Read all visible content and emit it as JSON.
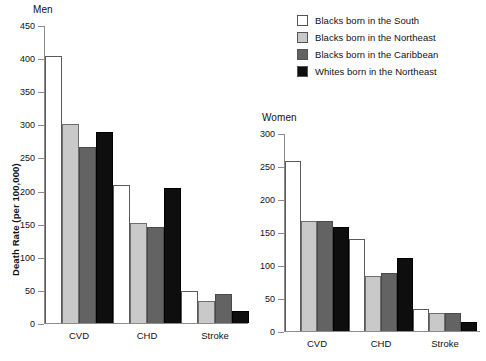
{
  "legend": {
    "position": "top-right",
    "entries": [
      {
        "label": "Blacks born in the South",
        "color": "#ffffff",
        "swatch_name": "legend-swatch-blacks-south"
      },
      {
        "label": "Blacks born in the Northeast",
        "color": "#c9c9c9",
        "swatch_name": "legend-swatch-blacks-northeast"
      },
      {
        "label": "Blacks born in the Caribbean",
        "color": "#636363",
        "swatch_name": "legend-swatch-blacks-caribbean"
      },
      {
        "label": "Whites born in the Northeast",
        "color": "#0e0e0e",
        "swatch_name": "legend-swatch-whites-northeast"
      }
    ]
  },
  "chart_data": [
    {
      "type": "bar",
      "title": "Men",
      "xlabel": "",
      "ylabel": "Death Rate (per 100,000)",
      "ylim": [
        0,
        450
      ],
      "yticks": [
        0,
        50,
        100,
        150,
        200,
        250,
        300,
        350,
        400,
        450
      ],
      "grid": false,
      "categories": [
        "CVD",
        "CHD",
        "Stroke"
      ],
      "series": [
        {
          "name": "Blacks born in the South",
          "color": "#ffffff",
          "values": [
            403,
            209,
            48
          ]
        },
        {
          "name": "Blacks born in the Northeast",
          "color": "#c9c9c9",
          "values": [
            300,
            151,
            34
          ]
        },
        {
          "name": "Blacks born in the Caribbean",
          "color": "#636363",
          "values": [
            266,
            145,
            44
          ]
        },
        {
          "name": "Whites born in the Northeast",
          "color": "#0e0e0e",
          "values": [
            288,
            204,
            18
          ]
        }
      ]
    },
    {
      "type": "bar",
      "title": "Women",
      "xlabel": "",
      "ylabel": "",
      "ylim": [
        0,
        300
      ],
      "yticks": [
        0,
        50,
        100,
        150,
        200,
        250,
        300
      ],
      "grid": false,
      "categories": [
        "CVD",
        "CHD",
        "Stroke"
      ],
      "series": [
        {
          "name": "Blacks born in the South",
          "color": "#ffffff",
          "values": [
            258,
            139,
            34
          ]
        },
        {
          "name": "Blacks born in the Northeast",
          "color": "#c9c9c9",
          "values": [
            166,
            83,
            28
          ]
        },
        {
          "name": "Blacks born in the Caribbean",
          "color": "#636363",
          "values": [
            166,
            88,
            28
          ]
        },
        {
          "name": "Whites born in the Northeast",
          "color": "#0e0e0e",
          "values": [
            157,
            110,
            13
          ]
        }
      ]
    }
  ]
}
